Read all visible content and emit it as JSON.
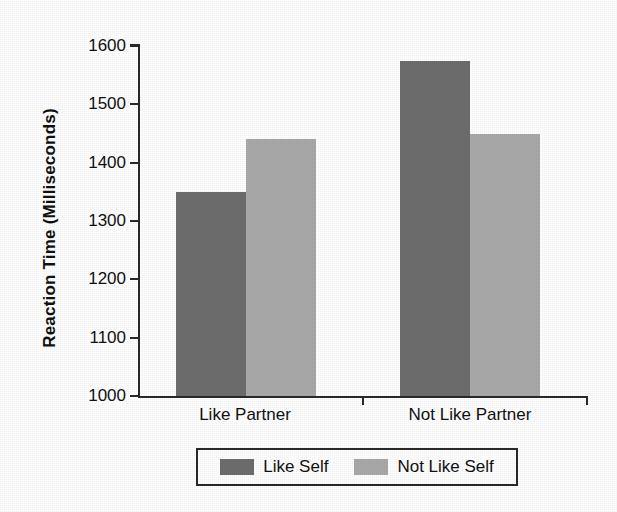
{
  "chart_data": {
    "type": "bar",
    "title": "",
    "xlabel": "",
    "ylabel": "Reaction Time (Milliseconds)",
    "categories": [
      "Like Partner",
      "Not Like Partner"
    ],
    "series": [
      {
        "name": "Like Self",
        "color": "#6e6e6e",
        "values": [
          1350,
          1575
        ]
      },
      {
        "name": "Not Like Self",
        "color": "#aaaaaa",
        "values": [
          1440,
          1450
        ]
      }
    ],
    "ylim": [
      1000,
      1600
    ],
    "ytick_step": 100,
    "yticks": [
      1600,
      1500,
      1400,
      1300,
      1200,
      1100,
      1000
    ],
    "ytick_labels": [
      "1600",
      "1500",
      "1400",
      "1300",
      "1200",
      "1100",
      "1000"
    ],
    "grid": false,
    "legend_position": "bottom",
    "bar_gap_within_group": 0
  },
  "axes": {
    "y_title": "Reaction Time (Milliseconds)"
  },
  "legend": {
    "entries": [
      {
        "label": "Like Self",
        "color": "#6e6e6e"
      },
      {
        "label": "Not Like Self",
        "color": "#aaaaaa"
      }
    ]
  }
}
